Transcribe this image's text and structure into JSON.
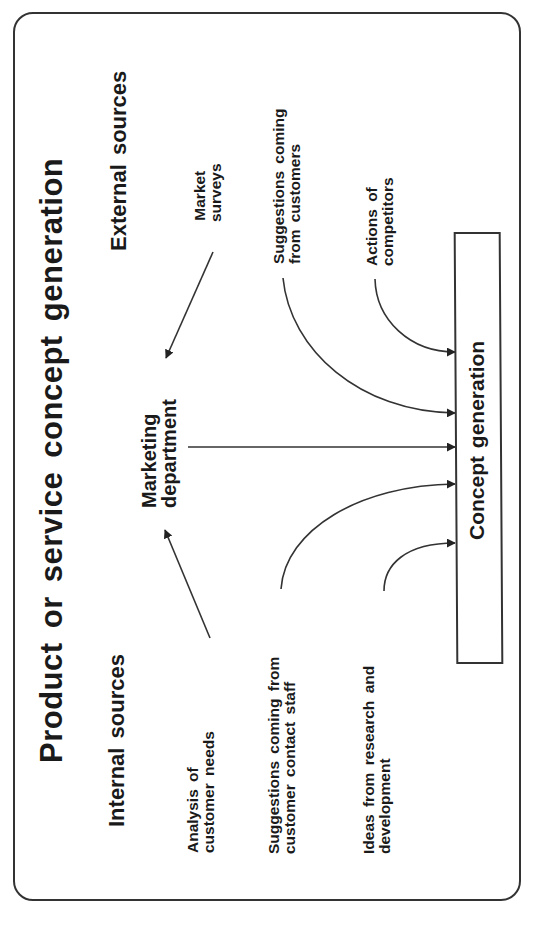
{
  "diagram": {
    "title": "Product or service concept generation",
    "orientation": "rotated -90deg (reads bottom to top)",
    "groups": {
      "external": {
        "heading": "External sources"
      },
      "internal": {
        "heading": "Internal sources"
      }
    },
    "nodes": {
      "marketing": {
        "line1": "Marketing",
        "line2": "department"
      },
      "concept": {
        "label": "Concept generation"
      },
      "market_surveys": {
        "line1": "Market",
        "line2": "surveys",
        "group": "external"
      },
      "customer_suggestions": {
        "line1": "Suggestions  coming",
        "line2": "from  customers",
        "group": "external"
      },
      "competitors": {
        "line1": "Actions of",
        "line2": "competitors",
        "group": "external"
      },
      "customer_needs": {
        "line1": "Analysis of",
        "line2": "customer  needs",
        "group": "internal"
      },
      "staff_suggestions": {
        "line1": "Suggestions  coming  from",
        "line2": "customer  contact  staff",
        "group": "internal"
      },
      "rnd": {
        "line1": "Ideas  from  research  and",
        "line2": "development",
        "group": "internal"
      }
    },
    "edges": [
      {
        "from": "market_surveys",
        "to": "marketing",
        "style": "straight-arrow"
      },
      {
        "from": "customer_needs",
        "to": "marketing",
        "style": "straight-arrow"
      },
      {
        "from": "marketing",
        "to": "concept",
        "style": "straight-arrow"
      },
      {
        "from": "customer_suggestions",
        "to": "concept",
        "style": "curved-arrow"
      },
      {
        "from": "competitors",
        "to": "concept",
        "style": "curved-arrow"
      },
      {
        "from": "staff_suggestions",
        "to": "concept",
        "style": "curved-arrow"
      },
      {
        "from": "rnd",
        "to": "concept",
        "style": "curved-arrow"
      }
    ],
    "colors": {
      "stroke": "#333333",
      "text": "#1a1a1a",
      "background": "#ffffff"
    }
  }
}
